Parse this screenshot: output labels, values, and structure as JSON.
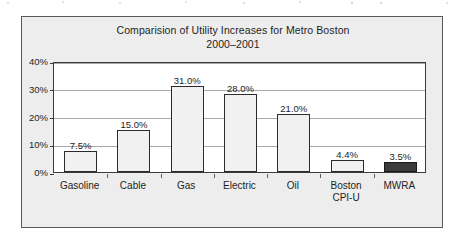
{
  "chart_data": {
    "type": "bar",
    "title": "Comparision of Utility Increases for Metro Boston",
    "subtitle": "2000–2001",
    "xlabel": "",
    "ylabel": "",
    "ylim": [
      0,
      40
    ],
    "grid": true,
    "legend": "none",
    "y_ticks": [
      "0%",
      "10%",
      "20%",
      "30%",
      "40%"
    ],
    "y_tick_values": [
      0,
      10,
      20,
      30,
      40
    ],
    "categories": [
      "Gasoline",
      "Cable",
      "Gas",
      "Electric",
      "Oil",
      "Boston\nCPI-U",
      "MWRA"
    ],
    "values": [
      7.5,
      15.0,
      31.0,
      28.0,
      21.0,
      4.4,
      3.5
    ],
    "data_labels": [
      "7.5%",
      "15.0%",
      "31.0%",
      "28.0%",
      "21.0%",
      "4.4%",
      "3.5%"
    ],
    "highlight_index": 6,
    "colors": {
      "bar_fill": "#f1f1f1",
      "bar_edge": "#2b2b2b",
      "highlight_fill": "#3b3b3b",
      "highlight_edge": "#1a1a1a",
      "panel_background": "#ededed",
      "plot_background": "#ffffff",
      "frame_border": "#5a5a5a",
      "gridline": "#a9a9a9",
      "text": "#1d1d1d"
    }
  }
}
